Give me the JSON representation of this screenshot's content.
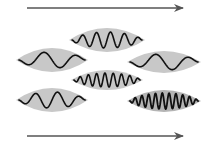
{
  "diagram": {
    "background": "#ffffff",
    "envelope_color": "#c8c8c8",
    "envelope_dark_color": "#b4b4b4",
    "wave_color": "#111111",
    "arrow_color": "#555555",
    "arrows": [
      {
        "name": "top-arrow",
        "x1": 27,
        "y1": 8,
        "x2": 183,
        "y2": 8
      },
      {
        "name": "bottom-arrow",
        "x1": 27,
        "y1": 136,
        "x2": 183,
        "y2": 136
      }
    ],
    "wave_packets": [
      {
        "name": "packet-top-center",
        "cx": 107,
        "cy": 40,
        "rx": 38,
        "ry": 12,
        "amp": 8,
        "cycles": 5,
        "stroke": 1.6
      },
      {
        "name": "packet-left-upper",
        "cx": 52,
        "cy": 60,
        "rx": 36,
        "ry": 12,
        "amp": 8,
        "cycles": 2,
        "stroke": 1.6
      },
      {
        "name": "packet-right-upper",
        "cx": 164,
        "cy": 62,
        "rx": 37,
        "ry": 11,
        "amp": 8,
        "cycles": 2,
        "stroke": 1.6
      },
      {
        "name": "packet-middle-center",
        "cx": 107,
        "cy": 80,
        "rx": 36,
        "ry": 10,
        "amp": 7,
        "cycles": 8,
        "stroke": 1.6
      },
      {
        "name": "packet-left-lower",
        "cx": 52,
        "cy": 100,
        "rx": 36,
        "ry": 12,
        "amp": 8,
        "cycles": 3,
        "stroke": 1.6
      },
      {
        "name": "packet-right-lower",
        "cx": 164,
        "cy": 101,
        "rx": 37,
        "ry": 11,
        "amp": 8,
        "cycles": 10,
        "stroke": 1.8,
        "dark": true
      }
    ]
  }
}
